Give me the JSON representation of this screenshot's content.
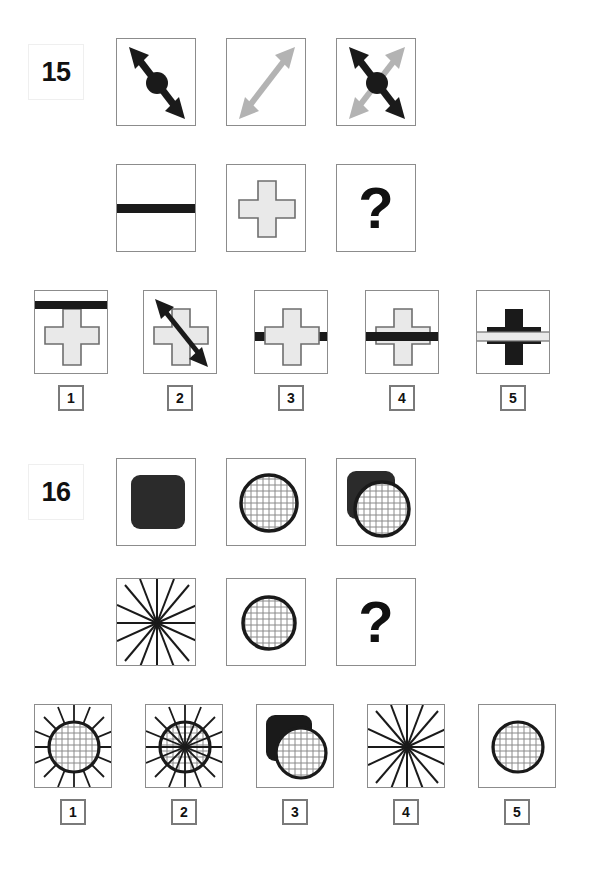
{
  "page": {
    "width": 596,
    "height": 877,
    "background": "#ffffff",
    "type": "non-verbal-reasoning-matrix-test"
  },
  "colors": {
    "dark": "#1a1a1a",
    "gray_arrow": "#b3b3b3",
    "light_fill": "#e9e9e9",
    "cell_border": "#8c8c8c",
    "box_border": "#7a7a7a",
    "grid_line": "#8a8a8a",
    "text": "#111111"
  },
  "items": [
    {
      "number": "15",
      "matrix_row1": [
        {
          "name": "dark-arrow-with-dot",
          "description": "black double-headed diagonal arrow NW-SE with filled circle at centre"
        },
        {
          "name": "gray-arrow",
          "description": "light gray double-headed diagonal arrow SW-NE"
        },
        {
          "name": "combined-arrows",
          "description": "gray SW-NE arrow plus black NW-SE arrow with centre dot overlaid"
        }
      ],
      "matrix_row2": [
        {
          "name": "dark-horizontal-bar",
          "description": "thick black horizontal bar across middle"
        },
        {
          "name": "light-cross",
          "description": "light gray outlined plus/cross shape"
        },
        {
          "name": "question-mark",
          "description": "question mark placeholder",
          "label": "?"
        }
      ],
      "options": [
        {
          "label": "1",
          "name": "cross-with-bar-on-top-edge",
          "description": "light cross with black bar near top of box"
        },
        {
          "label": "2",
          "name": "cross-with-diagonal-arrow",
          "description": "light cross with black diagonal double arrow"
        },
        {
          "label": "3",
          "name": "bar-behind-cross",
          "description": "black bar passing behind the light cross"
        },
        {
          "label": "4",
          "name": "bar-in-front-of-cross",
          "description": "black bar drawn over the light cross"
        },
        {
          "label": "5",
          "name": "dark-cross-with-light-bar",
          "description": "black cross with light gray bar over it"
        }
      ]
    },
    {
      "number": "16",
      "matrix_row1": [
        {
          "name": "dark-rounded-square",
          "description": "solid black rounded square"
        },
        {
          "name": "grid-circle",
          "description": "circle with thick black outline and fine grid hatching"
        },
        {
          "name": "square-and-circle",
          "description": "black rounded square upper-left with grid circle overlapping in front"
        }
      ],
      "matrix_row2": [
        {
          "name": "starburst",
          "description": "radial starburst of 16 straight lines filling the box"
        },
        {
          "name": "grid-circle",
          "description": "circle with thick black outline and fine grid hatching"
        },
        {
          "name": "question-mark",
          "description": "question mark placeholder",
          "label": "?"
        }
      ],
      "options": [
        {
          "label": "1",
          "name": "grid-circle-with-outer-rays",
          "description": "grid circle with rays only outside the circle"
        },
        {
          "label": "2",
          "name": "grid-circle-with-full-starburst",
          "description": "grid circle with starburst rays crossing through it"
        },
        {
          "label": "3",
          "name": "square-and-grid-circle",
          "description": "black rounded square with grid circle overlapping"
        },
        {
          "label": "4",
          "name": "starburst",
          "description": "radial starburst of straight lines only"
        },
        {
          "label": "5",
          "name": "grid-circle-only",
          "description": "grid circle alone"
        }
      ]
    }
  ]
}
